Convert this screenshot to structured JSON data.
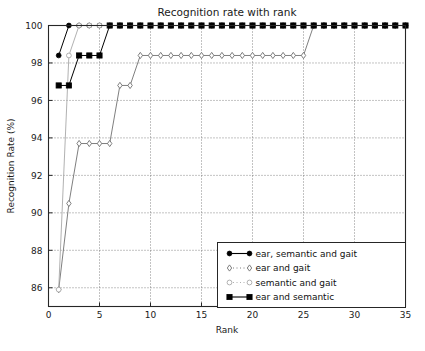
{
  "chart_data": {
    "type": "line",
    "title": "Recognition rate with rank",
    "xlabel": "Rank",
    "ylabel": "Recognition Rate (%)",
    "xlim": [
      0,
      35
    ],
    "ylim": [
      85,
      100
    ],
    "xticks": [
      0,
      5,
      10,
      15,
      20,
      25,
      30,
      35
    ],
    "yticks": [
      86,
      88,
      90,
      92,
      94,
      96,
      98,
      100
    ],
    "grid": true,
    "legend_position": "lower right",
    "x": [
      1,
      2,
      3,
      4,
      5,
      6,
      7,
      8,
      9,
      10,
      11,
      12,
      13,
      14,
      15,
      16,
      17,
      18,
      19,
      20,
      21,
      22,
      23,
      24,
      25,
      26,
      27,
      28,
      29,
      30,
      31,
      32,
      33,
      34,
      35
    ],
    "series": [
      {
        "name": "ear, semantic and gait",
        "marker": "filled-circle",
        "color": "#000000",
        "values": [
          98.4,
          100,
          100,
          100,
          100,
          100,
          100,
          100,
          100,
          100,
          100,
          100,
          100,
          100,
          100,
          100,
          100,
          100,
          100,
          100,
          100,
          100,
          100,
          100,
          100,
          100,
          100,
          100,
          100,
          100,
          100,
          100,
          100,
          100,
          100
        ]
      },
      {
        "name": "ear and gait",
        "marker": "open-diamond",
        "color": "#707070",
        "values": [
          85.9,
          90.5,
          93.7,
          93.7,
          93.7,
          93.7,
          96.8,
          96.8,
          98.4,
          98.4,
          98.4,
          98.4,
          98.4,
          98.4,
          98.4,
          98.4,
          98.4,
          98.4,
          98.4,
          98.4,
          98.4,
          98.4,
          98.4,
          98.4,
          98.4,
          100,
          100,
          100,
          100,
          100,
          100,
          100,
          100,
          100,
          100
        ]
      },
      {
        "name": "semantic and gait",
        "marker": "open-circle",
        "color": "#a8a8a8",
        "values": [
          85.9,
          98.4,
          100,
          100,
          100,
          100,
          100,
          100,
          100,
          100,
          100,
          100,
          100,
          100,
          100,
          100,
          100,
          100,
          100,
          100,
          100,
          100,
          100,
          100,
          100,
          100,
          100,
          100,
          100,
          100,
          100,
          100,
          100,
          100,
          100
        ]
      },
      {
        "name": "ear and semantic",
        "marker": "filled-square",
        "color": "#000000",
        "values": [
          96.8,
          96.8,
          98.4,
          98.4,
          98.4,
          100,
          100,
          100,
          100,
          100,
          100,
          100,
          100,
          100,
          100,
          100,
          100,
          100,
          100,
          100,
          100,
          100,
          100,
          100,
          100,
          100,
          100,
          100,
          100,
          100,
          100,
          100,
          100,
          100,
          100
        ]
      }
    ],
    "note_gait_diamond_mid": [
      95.3
    ]
  }
}
